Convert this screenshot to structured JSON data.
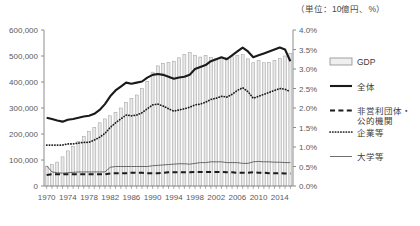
{
  "unit_note": "（単位：10億円、%）",
  "legend": {
    "items": [
      {
        "key": "gdp",
        "label": "GDP",
        "style": "bar-swatch"
      },
      {
        "key": "total",
        "label": "全体",
        "style": "thick-solid"
      },
      {
        "key": "nonprofit",
        "label": "非営利団体・\n公的機関",
        "style": "dashed"
      },
      {
        "key": "company",
        "label": "企業等",
        "style": "dotted"
      },
      {
        "key": "university",
        "label": "大学等",
        "style": "thin-solid"
      }
    ]
  },
  "chart_data": {
    "type": "bar",
    "title": "（単位：10億円、%）",
    "xlabel": "",
    "ylabel": "",
    "grid": false,
    "legend_position": "right",
    "x": [
      1970,
      1971,
      1972,
      1973,
      1974,
      1975,
      1976,
      1977,
      1978,
      1979,
      1980,
      1981,
      1982,
      1983,
      1984,
      1985,
      1986,
      1987,
      1988,
      1989,
      1990,
      1991,
      1992,
      1993,
      1994,
      1995,
      1996,
      1997,
      1998,
      1999,
      2000,
      2001,
      2002,
      2003,
      2004,
      2005,
      2006,
      2007,
      2008,
      2009,
      2010,
      2011,
      2012,
      2013,
      2014,
      2015,
      2016
    ],
    "xtick_labels": [
      1970,
      1974,
      1978,
      1982,
      1986,
      1990,
      1994,
      1998,
      2002,
      2006,
      2010,
      2014
    ],
    "left_axis": {
      "label": "10億円",
      "ticks": [
        "0",
        "100,000",
        "200,000",
        "300,000",
        "400,000",
        "500,000",
        "600,000"
      ],
      "min": 0,
      "max": 600000,
      "step": 100000
    },
    "right_axis": {
      "label": "%",
      "ticks": [
        "0.0%",
        "0.5%",
        "1.0%",
        "1.5%",
        "2.0%",
        "2.5%",
        "3.0%",
        "3.5%",
        "4.0%"
      ],
      "min": 0,
      "max": 4.0,
      "step": 0.5
    },
    "series": [
      {
        "name": "GDP",
        "type": "bar",
        "axis": "left",
        "unit": "10億円",
        "values": [
          75000,
          82000,
          92000,
          112000,
          135000,
          152000,
          171000,
          190000,
          209000,
          225000,
          243000,
          258000,
          270000,
          282000,
          300000,
          321000,
          337000,
          350000,
          375000,
          403000,
          438000,
          462000,
          472000,
          475000,
          480000,
          493000,
          505000,
          513000,
          503000,
          496000,
          502000,
          494000,
          489000,
          490000,
          494000,
          497000,
          501000,
          505000,
          489000,
          474000,
          482000,
          474000,
          475000,
          483000,
          490000,
          500000,
          510000
        ]
      },
      {
        "name": "全体",
        "type": "line",
        "style": "thick-solid",
        "axis": "right",
        "unit": "%",
        "values": [
          1.75,
          1.72,
          1.68,
          1.65,
          1.7,
          1.72,
          1.75,
          1.78,
          1.8,
          1.85,
          1.95,
          2.1,
          2.3,
          2.45,
          2.55,
          2.65,
          2.62,
          2.65,
          2.68,
          2.78,
          2.85,
          2.87,
          2.85,
          2.8,
          2.75,
          2.78,
          2.8,
          2.85,
          3.0,
          3.05,
          3.1,
          3.2,
          3.25,
          3.3,
          3.25,
          3.35,
          3.45,
          3.55,
          3.45,
          3.3,
          3.35,
          3.4,
          3.45,
          3.5,
          3.55,
          3.5,
          3.2
        ]
      },
      {
        "name": "企業等",
        "type": "line",
        "style": "dotted",
        "axis": "right",
        "unit": "%",
        "values": [
          1.05,
          1.05,
          1.05,
          1.05,
          1.08,
          1.08,
          1.1,
          1.12,
          1.12,
          1.18,
          1.25,
          1.35,
          1.5,
          1.62,
          1.72,
          1.82,
          1.8,
          1.82,
          1.88,
          1.98,
          2.08,
          2.1,
          2.05,
          1.98,
          1.92,
          1.95,
          1.98,
          2.02,
          2.08,
          2.1,
          2.15,
          2.22,
          2.25,
          2.3,
          2.28,
          2.35,
          2.45,
          2.52,
          2.42,
          2.25,
          2.3,
          2.35,
          2.4,
          2.45,
          2.5,
          2.48,
          2.42
        ]
      },
      {
        "name": "大学等",
        "type": "line",
        "style": "thin-solid",
        "axis": "right",
        "unit": "%",
        "values": [
          0.52,
          0.36,
          0.34,
          0.33,
          0.34,
          0.35,
          0.36,
          0.36,
          0.36,
          0.36,
          0.36,
          0.36,
          0.48,
          0.5,
          0.5,
          0.5,
          0.5,
          0.5,
          0.5,
          0.5,
          0.52,
          0.53,
          0.54,
          0.55,
          0.56,
          0.57,
          0.57,
          0.56,
          0.58,
          0.6,
          0.6,
          0.62,
          0.62,
          0.62,
          0.6,
          0.6,
          0.6,
          0.58,
          0.58,
          0.62,
          0.63,
          0.62,
          0.62,
          0.61,
          0.61,
          0.6,
          0.6
        ]
      },
      {
        "name": "非営利団体・公的機関",
        "type": "line",
        "style": "dashed",
        "axis": "right",
        "unit": "%",
        "values": [
          0.28,
          0.3,
          0.3,
          0.3,
          0.3,
          0.3,
          0.3,
          0.3,
          0.3,
          0.3,
          0.3,
          0.3,
          0.32,
          0.33,
          0.33,
          0.33,
          0.34,
          0.34,
          0.34,
          0.33,
          0.33,
          0.33,
          0.34,
          0.35,
          0.35,
          0.35,
          0.35,
          0.35,
          0.36,
          0.36,
          0.36,
          0.36,
          0.36,
          0.36,
          0.35,
          0.35,
          0.34,
          0.34,
          0.34,
          0.35,
          0.34,
          0.34,
          0.33,
          0.33,
          0.33,
          0.32,
          0.32
        ]
      }
    ]
  }
}
